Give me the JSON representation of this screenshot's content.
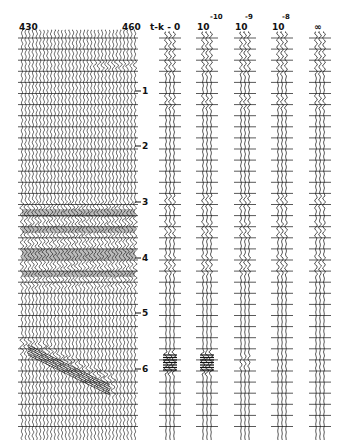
{
  "figure": {
    "type": "seismic trace comparison",
    "main_section": {
      "trace_labels": {
        "left": "430",
        "right": "460"
      },
      "time_axis": {
        "labels": [
          "1",
          "2",
          "3",
          "4",
          "5",
          "6"
        ]
      }
    },
    "panels": [
      {
        "label": "t-k - 0",
        "base": "",
        "exponent": ""
      },
      {
        "label": "10^-10",
        "base": "10",
        "exponent": "-10"
      },
      {
        "label": "10^-9",
        "base": "10",
        "exponent": "-9"
      },
      {
        "label": "10^-8",
        "base": "10",
        "exponent": "-8"
      },
      {
        "label": "∞",
        "base": "∞",
        "exponent": ""
      }
    ],
    "colors": {
      "ink": "#111111",
      "background": "#ffffff"
    }
  }
}
